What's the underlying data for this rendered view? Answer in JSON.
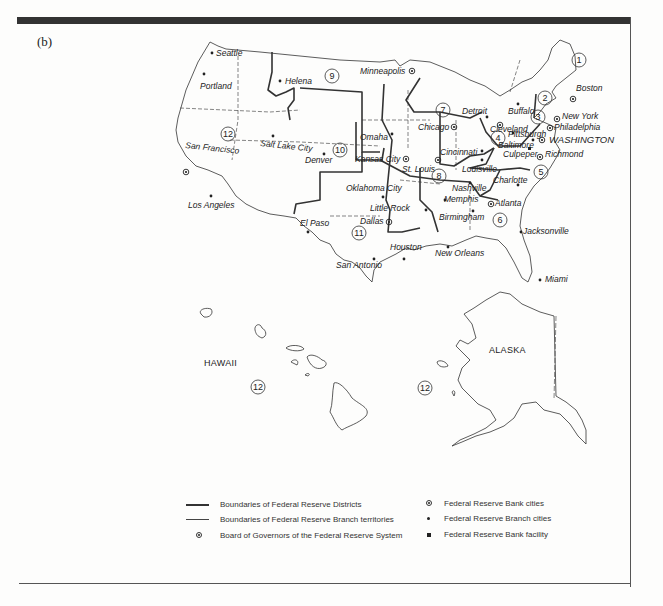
{
  "panel_label": "(b)",
  "map": {
    "title": "Federal Reserve System districts map",
    "regions": {
      "hawaii": "HAWAII",
      "alaska": "ALASKA"
    },
    "districts": [
      "1",
      "2",
      "3",
      "4",
      "5",
      "6",
      "7",
      "8",
      "9",
      "10",
      "11",
      "12",
      "12",
      "12"
    ],
    "reserve_bank_cities": [
      "Boston",
      "New York",
      "Philadelphia",
      "Cleveland",
      "Richmond",
      "Atlanta",
      "Chicago",
      "St. Louis",
      "Minneapolis",
      "Kansas City",
      "Dallas",
      "San Francisco"
    ],
    "branch_cities": [
      "Seattle",
      "Portland",
      "Helena",
      "Salt Lake City",
      "Denver",
      "Los Angeles",
      "Omaha",
      "Oklahoma City",
      "El Paso",
      "Houston",
      "San Antonio",
      "Little Rock",
      "Memphis",
      "Louisville",
      "Nashville",
      "Birmingham",
      "New Orleans",
      "Jacksonville",
      "Miami",
      "Charlotte",
      "Baltimore",
      "Pittsburgh",
      "Cincinnati",
      "Detroit",
      "Buffalo"
    ],
    "board_of_governors": "WASHINGTON",
    "bank_facility": [
      "Culpeper"
    ],
    "labels": {
      "seattle": "Seattle",
      "portland": "Portland",
      "helena": "Helena",
      "minneapolis": "Minneapolis",
      "san_francisco": "San Francisco",
      "salt_lake_city": "Salt Lake City",
      "denver": "Denver",
      "omaha": "Omaha",
      "kansas_city": "Kansas City",
      "st_louis": "St. Louis",
      "chicago": "Chicago",
      "detroit": "Detroit",
      "cleveland": "Cleveland",
      "buffalo": "Buffalo",
      "pittsburgh": "Pittsburgh",
      "boston": "Boston",
      "new_york": "New York",
      "philadelphia": "Philadelphia",
      "washington": "WASHINGTON",
      "baltimore": "Baltimore",
      "culpeper": "Culpeper",
      "richmond": "Richmond",
      "cincinnati": "Cincinnati",
      "louisville": "Louisville",
      "nashville": "Nashville",
      "charlotte": "Charlotte",
      "memphis": "Memphis",
      "atlanta": "Atlanta",
      "little_rock": "Little Rock",
      "birmingham": "Birmingham",
      "jacksonville": "Jacksonville",
      "oklahoma_city": "Oklahoma City",
      "dallas": "Dallas",
      "el_paso": "El Paso",
      "los_angeles": "Los Angeles",
      "houston": "Houston",
      "san_antonio": "San Antonio",
      "new_orleans": "New Orleans",
      "miami": "Miami"
    }
  },
  "legend": {
    "district_boundaries": "Boundaries of Federal Reserve Districts",
    "branch_boundaries": "Boundaries of Federal Reserve Branch territories",
    "board_of_governors": "Board of Governors of the Federal Reserve System",
    "bank_cities": "Federal Reserve Bank cities",
    "branch_cities": "Federal Reserve Branch cities",
    "bank_facility": "Federal Reserve Bank facility"
  }
}
